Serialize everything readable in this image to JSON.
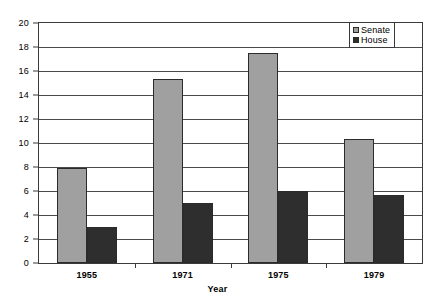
{
  "chart_data": {
    "type": "bar",
    "title": "",
    "subtitle": "",
    "categories": [
      "1955",
      "1971",
      "1975",
      "1979"
    ],
    "series": [
      {
        "name": "Senate",
        "color": "#a0a0a0",
        "values": [
          7.9,
          15.3,
          17.5,
          10.3
        ]
      },
      {
        "name": "House",
        "color": "#2e2e2e",
        "values": [
          3.0,
          5.0,
          6.0,
          5.7
        ]
      }
    ],
    "xlabel": "Year",
    "ylabel": "",
    "ylim": [
      0,
      20
    ],
    "y_ticks": [
      0,
      2,
      4,
      6,
      8,
      10,
      12,
      14,
      16,
      18,
      20
    ],
    "y_tick_labels": [
      "0",
      "2",
      "4",
      "6",
      "8",
      "10",
      "12",
      "14",
      "16",
      "18",
      "20"
    ],
    "grid": true,
    "grid_axis": "y",
    "legend_position": "top-right",
    "legend_entries": [
      "Senate",
      "House"
    ],
    "plot_background": "#ffffff",
    "axis_color": "#3a3a3a"
  }
}
